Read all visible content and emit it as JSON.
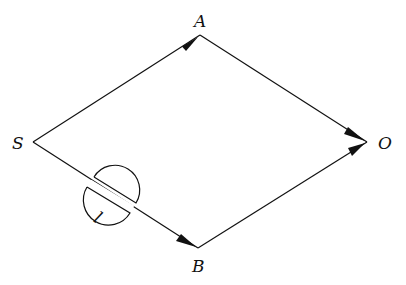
{
  "diagram": {
    "title": "",
    "nodes": [
      {
        "id": "S",
        "label": "S",
        "x": 33,
        "y": 142
      },
      {
        "id": "A",
        "label": "A",
        "x": 200,
        "y": 35
      },
      {
        "id": "O",
        "label": "O",
        "x": 367,
        "y": 142
      },
      {
        "id": "B",
        "label": "B",
        "x": 198,
        "y": 248
      }
    ],
    "edges": [
      {
        "from": "S",
        "to": "A",
        "arrow": "end"
      },
      {
        "from": "A",
        "to": "O",
        "arrow": "end"
      },
      {
        "from": "S",
        "to": "B",
        "arrow": "end"
      },
      {
        "from": "B",
        "to": "O",
        "arrow": "end"
      }
    ],
    "plate": {
      "on_edge": "S-B",
      "label": "l"
    }
  }
}
